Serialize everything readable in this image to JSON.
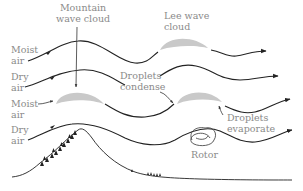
{
  "diagram": {
    "labels": {
      "mountain_wave_cloud": [
        "Mountain",
        "wave cloud"
      ],
      "lee_wave_cloud": [
        "Lee wave",
        "cloud"
      ],
      "droplets_condense": [
        "Droplets",
        "condense"
      ],
      "droplets_evaporate": [
        "Droplets",
        "evaporate"
      ],
      "rotor": "Rotor",
      "layers": [
        {
          "line1": "Moist",
          "line2": "air"
        },
        {
          "line1": "Dry",
          "line2": "air"
        },
        {
          "line1": "Moist",
          "line2": "air"
        },
        {
          "line1": "Dry",
          "line2": "air"
        }
      ]
    },
    "colors": {
      "line": "#222222",
      "cloud": "#c9c9c9",
      "label": "#8a8a8a",
      "background": "#ffffff"
    }
  }
}
